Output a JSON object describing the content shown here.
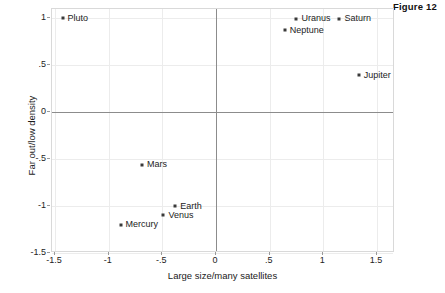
{
  "figure": {
    "caption": "Figure 12"
  },
  "chart_data": {
    "type": "scatter",
    "title": "Figure 12",
    "xlabel": "Large size/many satellites",
    "ylabel": "Far out/low density",
    "xlim": [
      -1.75,
      1.7
    ],
    "ylim": [
      -1.6,
      1.15
    ],
    "xticks": [
      "-1.5",
      "-1",
      "-.5",
      "0",
      ".5",
      "1",
      "1.5"
    ],
    "xtick_values": [
      -1.5,
      -1,
      -0.5,
      0,
      0.5,
      1,
      1.5
    ],
    "yticks": [
      "1",
      ".5",
      "0",
      "-.5",
      "-1",
      "-1.5"
    ],
    "ytick_values": [
      1,
      0.5,
      0,
      -0.5,
      -1,
      -1.5
    ],
    "grid": true,
    "legend": "none",
    "marker_color": "#3a3a3a",
    "axis_color": "#8c8c8c",
    "grid_color": "#ececec",
    "points": [
      {
        "label": "Pluto",
        "x": -1.43,
        "y": 1.0,
        "label_side": "right"
      },
      {
        "label": "Uranus",
        "x": 0.75,
        "y": 0.99,
        "label_side": "right"
      },
      {
        "label": "Saturn",
        "x": 1.15,
        "y": 0.99,
        "label_side": "right"
      },
      {
        "label": "Neptune",
        "x": 0.64,
        "y": 0.87,
        "label_side": "right"
      },
      {
        "label": "Jupiter",
        "x": 1.33,
        "y": 0.39,
        "label_side": "right"
      },
      {
        "label": "Mars",
        "x": -0.69,
        "y": -0.56,
        "label_side": "right"
      },
      {
        "label": "Earth",
        "x": -0.38,
        "y": -1.0,
        "label_side": "right"
      },
      {
        "label": "Venus",
        "x": -0.49,
        "y": -1.1,
        "label_side": "right"
      },
      {
        "label": "Mercury",
        "x": -0.89,
        "y": -1.2,
        "label_side": "right"
      }
    ]
  }
}
